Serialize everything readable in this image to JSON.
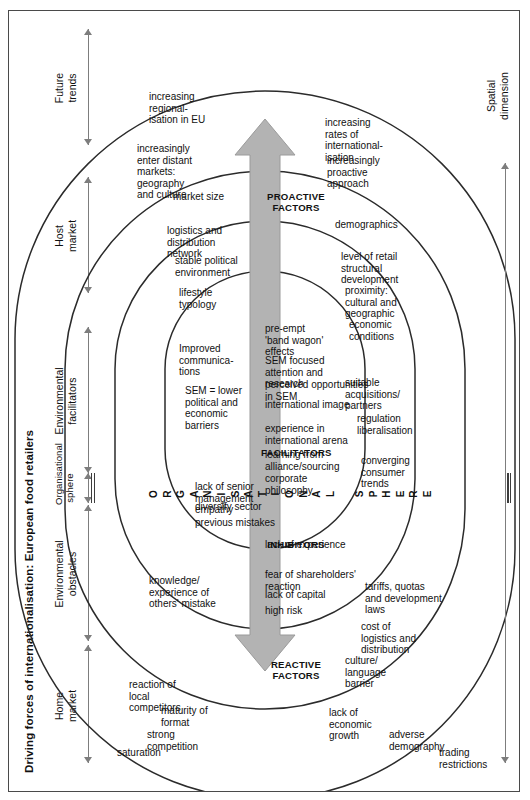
{
  "figure": {
    "title": "Driving forces of internationalisation: European food retailers",
    "background": "#ffffff",
    "frame_color": "#4a4a4a",
    "arc_color": "#2b2b2b",
    "arrow_color": "#b3b3b3",
    "band_color": "#bdbdbd"
  },
  "column_headers": [
    {
      "id": "home-market",
      "label": "Home\nmarket"
    },
    {
      "id": "environmental-obstacles",
      "label": "Environmental\nobstacles"
    },
    {
      "id": "environmental-facilitators",
      "label": "Environmental\nfacilitators"
    },
    {
      "id": "host-market",
      "label": "Host\nmarket"
    },
    {
      "id": "future-trends",
      "label": "Future\ntrends"
    }
  ],
  "organisational_sphere_label": "Organisational\nsphere",
  "dimensions": {
    "spatial": "Spatial\ndimension",
    "temporal": "Temporal\ndimension"
  },
  "band_letters": {
    "word_one": "ORGANISATIONAL",
    "word_two": "SPHERE",
    "letters_one": [
      "O",
      "R",
      "G",
      "A",
      "N",
      "I",
      "S",
      "A",
      "T",
      "I",
      "O",
      "N",
      "A",
      "L"
    ],
    "letters_two": [
      "S",
      "P",
      "H",
      "E",
      "R",
      "E"
    ]
  },
  "zones": {
    "reactive": "REACTIVE\nFACTORS",
    "inhibitors": "INHIBITORS",
    "facilitators": "FACILITATORS",
    "proactive": "PROACTIVE\nFACTORS"
  },
  "rings": {
    "home_market_outer": [
      "trading\nrestrictions",
      "adverse\ndemography",
      "lack of\neconomic\ngrowth"
    ],
    "home_market_inner": [
      "saturation",
      "strong\ncompetition",
      "maturity of\nformat",
      "reaction of\nlocal\ncompetitors"
    ],
    "environmental_obstacles_outer": [
      "culture/\nlanguage\nbarrier",
      "cost of\nlogistics and\ndistribution",
      "tariffs, quotas\nand development\nlaws"
    ],
    "environmental_obstacles_inner": [
      "knowledge/\nexperience of\nothers' mistake"
    ],
    "inhibitors": [
      "high risk",
      "lack of capital",
      "fear of shareholders'\nreaction",
      "lack of experience",
      "previous mistakes",
      "diversify sector",
      "lack of senior\nmanagement\nempathy"
    ],
    "facilitators": [
      "corporate\nphilosophy",
      "learning from\nalliance/sourcing",
      "experience in\ninternational arena",
      "international image",
      "perceived opportunities\nin SEM",
      "SEM focused\nattention and\nresearch",
      "pre-empt\n'band wagon'\neffects"
    ],
    "environmental_facilitators_outer": [
      "converging\nconsumer\ntrends",
      "regulation\nliberalisation"
    ],
    "environmental_facilitators_inner": [
      "suitable\nacquisitions/\npartners",
      "SEM = lower\npolitical and\neconomic\nbarriers",
      "Improved\ncommunica-\ntions"
    ],
    "host_market_outer": [
      "economic\nconditions",
      "proximity:\ncultural and\ngeographic",
      "level of retail\nstructural\ndevelopment",
      "demographics"
    ],
    "host_market_inner": [
      "lifestyle\ntypology",
      "stable political\nenvironment",
      "logistics and\ndistribution\nnetwork",
      "market size"
    ],
    "future_trends_outer": [
      "increasingly\nproactive\napproach",
      "increasing\nrates of\ninternational-\nisation"
    ],
    "future_trends_inner": [
      "increasingly\nenter distant\nmarkets:\ngeography\nand culture",
      "increasing\nregional-\nisation in EU"
    ]
  }
}
